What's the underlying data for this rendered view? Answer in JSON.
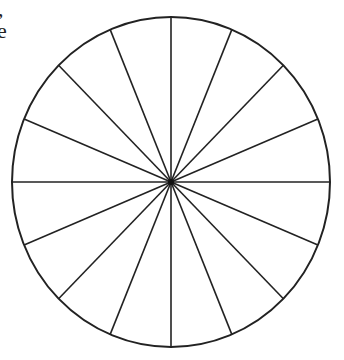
{
  "text_fragments": {
    "line1": ",",
    "line2": "e"
  },
  "diagram": {
    "type": "segmented-circle",
    "segments": 16,
    "center": [
      171,
      182
    ],
    "rx": 159,
    "ry": 165,
    "stroke_color": "#222222",
    "fill_color": "#ffffff"
  }
}
